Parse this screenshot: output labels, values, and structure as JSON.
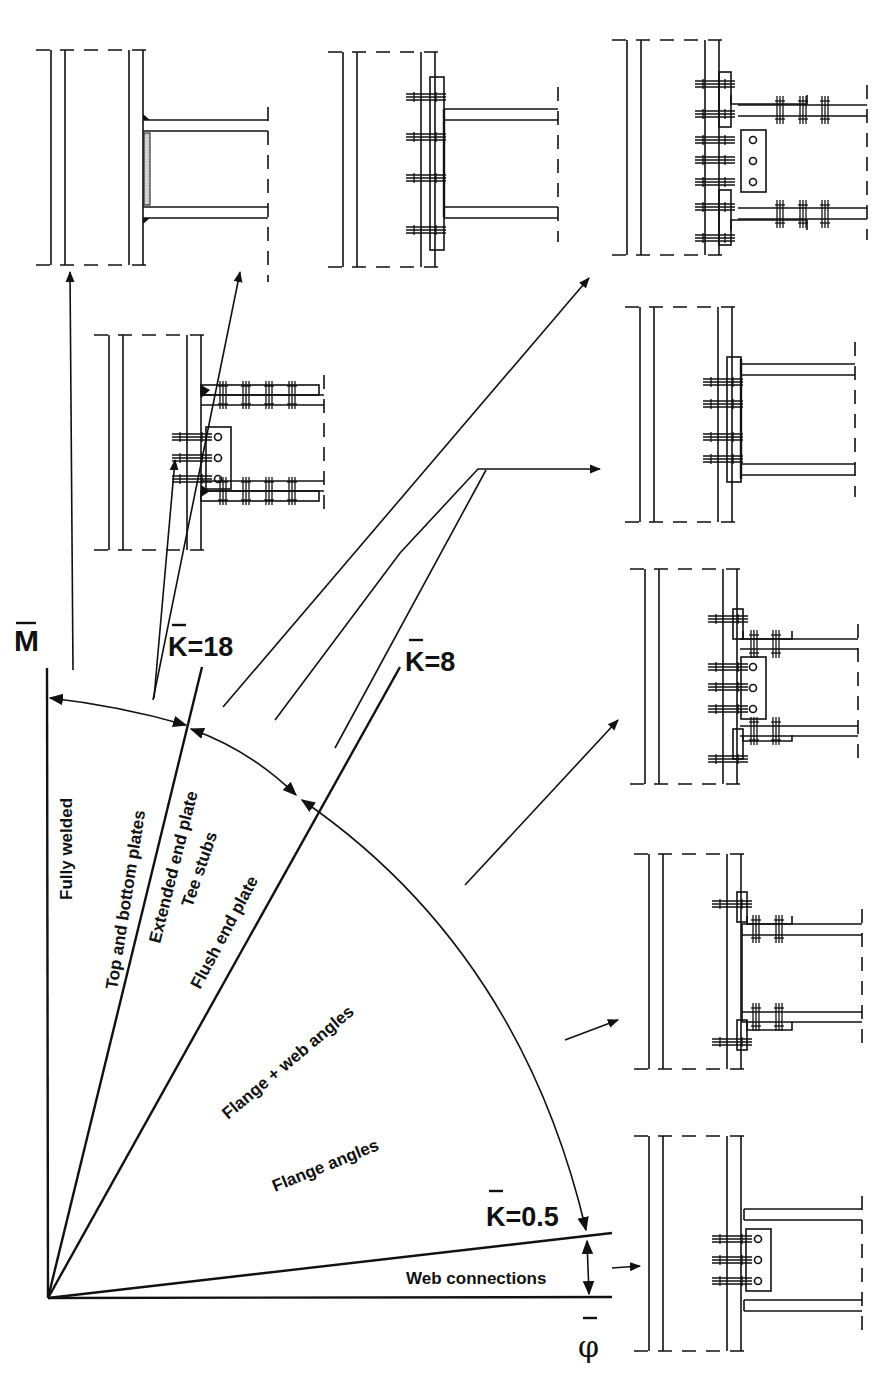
{
  "diagram": {
    "axes": {
      "y_label": "M",
      "x_label": "φ",
      "overbar": "—"
    },
    "stiffness_boundaries": [
      {
        "id": "k18",
        "label": "K=18"
      },
      {
        "id": "k8",
        "label": "K=8"
      },
      {
        "id": "k05",
        "label": "K=0.5"
      }
    ],
    "zones": [
      {
        "id": "fully-welded",
        "label": "Fully welded"
      },
      {
        "id": "top-bottom-plates",
        "label": "Top and bottom plates"
      },
      {
        "id": "extended-end-plate",
        "label": "Extended end plate"
      },
      {
        "id": "tee-stubs",
        "label": "Tee stubs"
      },
      {
        "id": "flush-end-plate",
        "label": "Flush end plate"
      },
      {
        "id": "flange-web-angles",
        "label": "Flange + web angles"
      },
      {
        "id": "flange-angles",
        "label": "Flange angles"
      },
      {
        "id": "web-connections",
        "label": "Web connections"
      }
    ],
    "joint_details": [
      {
        "id": "fully-welded",
        "type": "welded"
      },
      {
        "id": "extended-end-plate",
        "type": "extended-end-plate"
      },
      {
        "id": "tee-stubs",
        "type": "tee-stubs"
      },
      {
        "id": "top-bottom-plates",
        "type": "top-bottom-plates"
      },
      {
        "id": "flush-end-plate",
        "type": "flush-end-plate"
      },
      {
        "id": "flange-web-angles",
        "type": "flange-web-angles"
      },
      {
        "id": "flange-angles",
        "type": "flange-angles"
      },
      {
        "id": "web-connections",
        "type": "web-cleat"
      }
    ],
    "colors": {
      "ink": "#111111",
      "paper": "#ffffff"
    }
  }
}
